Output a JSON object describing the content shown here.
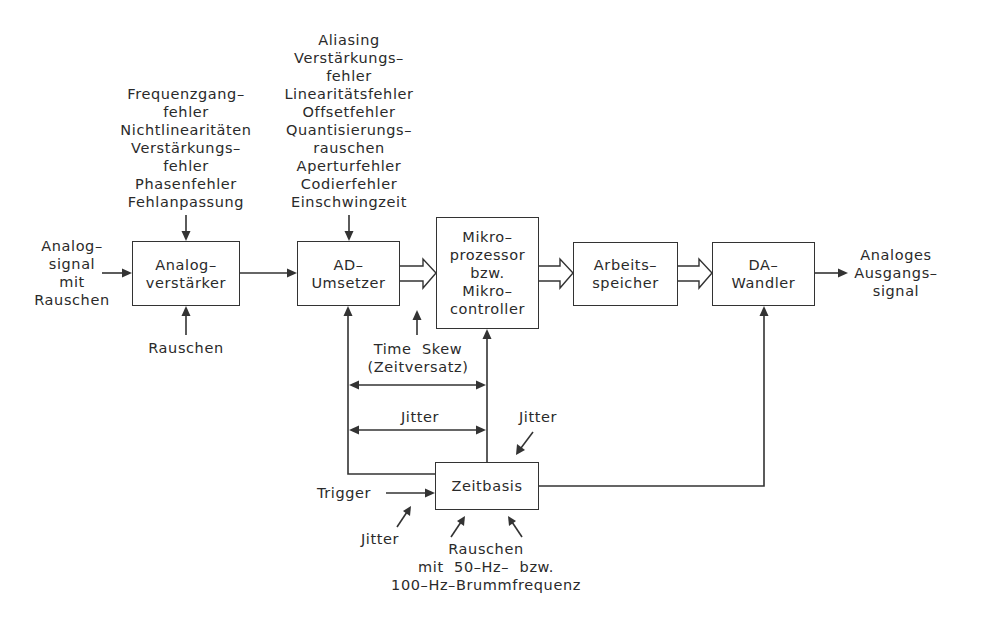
{
  "blocks": {
    "analog_amp": {
      "lines": [
        "Analog–",
        "verstärker"
      ]
    },
    "ad_converter": {
      "lines": [
        "AD–",
        "Umsetzer"
      ]
    },
    "microprocessor": {
      "lines": [
        "Mikro–",
        "prozessor",
        "bzw.",
        "Mikro–",
        "controller"
      ]
    },
    "memory": {
      "lines": [
        "Arbeits–",
        "speicher"
      ]
    },
    "da_converter": {
      "lines": [
        "DA–",
        "Wandler"
      ]
    },
    "timebase": {
      "lines": [
        "Zeitbasis"
      ]
    }
  },
  "labels": {
    "input_signal": [
      "Analog–",
      "signal",
      "mit",
      "Rauschen"
    ],
    "output_signal": [
      "Analoges",
      "Ausgangs–",
      "signal"
    ],
    "amp_errors": [
      "Frequenzgang–",
      "fehler",
      "Nichtlinearitäten",
      "Verstärkungs–",
      "fehler",
      "Phasenfehler",
      "Fehlanpassung"
    ],
    "amp_noise": [
      "Rauschen"
    ],
    "adc_errors": [
      "Aliasing",
      "Verstärkungs–",
      "fehler",
      "Linearitätsfehler",
      "Offsetfehler",
      "Quantisierungs–",
      "rauschen",
      "Aperturfehler",
      "Codierfehler",
      "Einschwingzeit"
    ],
    "time_skew": [
      "Time  Skew",
      "(Zeitversatz)"
    ],
    "jitter_between": [
      "Jitter"
    ],
    "jitter_timebase": [
      "Jitter"
    ],
    "trigger": [
      "Trigger"
    ],
    "jitter_trigger": [
      "Jitter"
    ],
    "timebase_noise": [
      "Rauschen",
      "mit  50–Hz–  bzw.",
      "100–Hz–Brummfrequenz"
    ]
  },
  "colors": {
    "ink": "#333333",
    "background": "#ffffff"
  }
}
